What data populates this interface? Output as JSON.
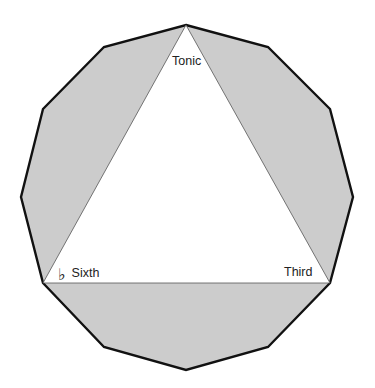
{
  "diagram": {
    "shape": "dodecagon",
    "sides": 12,
    "fill_color": "#cccccc",
    "stroke_color": "#111111",
    "inner_fill_color": "#ffffff",
    "inner_stroke_color": "#555555",
    "inscribed_shape": "triangle",
    "labels": {
      "tonic": "Tonic",
      "third": "Third",
      "sixth": "Sixth",
      "sixth_accidental": "♭"
    }
  }
}
